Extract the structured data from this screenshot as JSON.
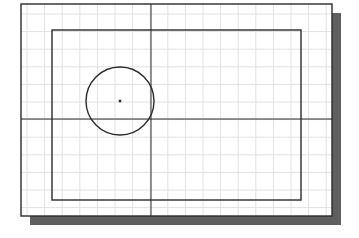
{
  "diagram": {
    "colors": {
      "background": "#ffffff",
      "paper": "#ffffff",
      "grid": "#e2e2e2",
      "line": "#2b2b2b",
      "shadow": "#5f5f5f"
    },
    "frame": {
      "x": 21,
      "y": 4,
      "width": 311,
      "height": 212
    },
    "shadow": {
      "offset_x": 9,
      "offset_y": 9
    },
    "grid": {
      "spacing": 17.6,
      "origin_x": 27,
      "origin_y": 14
    },
    "inner_rectangle": {
      "x": 52,
      "y": 30,
      "width": 249,
      "height": 170
    },
    "circle": {
      "cx": 120,
      "cy": 101,
      "r": 34
    },
    "center_point": {
      "x": 120,
      "y": 101,
      "size": 2.5
    },
    "construction_lines": {
      "vertical": {
        "x": 151
      },
      "horizontal": {
        "y": 119
      }
    }
  }
}
